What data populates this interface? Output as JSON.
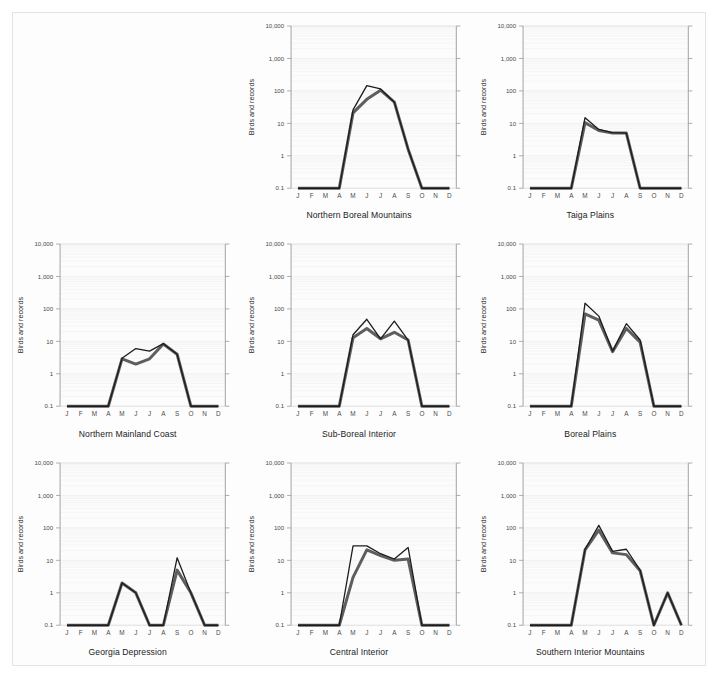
{
  "figure": {
    "background_color": "#fdfdfd",
    "frame_color": "#e3e3e3",
    "axis_color": "#9a9a9a",
    "grid_major_color": "#d8d8d8",
    "grid_minor_color": "#efefef",
    "thin_line_color": "#1c1c1c",
    "thick_line_color": "#5e5e5e",
    "y_axis_label": "Birds and records",
    "y_tick_labels": [
      "10,000",
      "1,000",
      "100",
      "10",
      "1",
      "0.1"
    ],
    "x_tick_labels": [
      "J",
      "F",
      "M",
      "A",
      "M",
      "J",
      "J",
      "A",
      "S",
      "O",
      "N",
      "D"
    ],
    "panel_order": [
      "empty",
      "northern-boreal-mountains",
      "taiga-plains",
      "northern-mainland-coast",
      "sub-boreal-interior",
      "boreal-plains",
      "georgia-depression",
      "central-interior",
      "southern-interior-mountains"
    ]
  },
  "chart_data": [
    {
      "type": "line",
      "title": "Northern Boreal Mountains",
      "xlabel": "",
      "ylabel": "Birds and records",
      "yscale": "log",
      "ylim": [
        0.1,
        10000
      ],
      "grid": true,
      "categories": [
        "J",
        "F",
        "M",
        "A",
        "M",
        "J",
        "J",
        "A",
        "S",
        "O",
        "N",
        "D"
      ],
      "series": [
        {
          "name": "records",
          "style": "thin",
          "values": [
            0.1,
            0.1,
            0.1,
            0.1,
            26,
            145,
            115,
            45,
            1.6,
            0.1,
            0.1,
            0.1
          ]
        },
        {
          "name": "birds",
          "style": "thick",
          "values": [
            0.1,
            0.1,
            0.1,
            0.1,
            21,
            55,
            105,
            45,
            1.6,
            0.1,
            0.1,
            0.1
          ]
        }
      ]
    },
    {
      "type": "line",
      "title": "Taiga Plains",
      "xlabel": "",
      "ylabel": "Birds and records",
      "yscale": "log",
      "ylim": [
        0.1,
        10000
      ],
      "grid": true,
      "categories": [
        "J",
        "F",
        "M",
        "A",
        "M",
        "J",
        "J",
        "A",
        "S",
        "O",
        "N",
        "D"
      ],
      "series": [
        {
          "name": "records",
          "style": "thin",
          "values": [
            0.1,
            0.1,
            0.1,
            0.1,
            15,
            6.5,
            5.2,
            5.0,
            0.1,
            0.1,
            0.1,
            0.1
          ]
        },
        {
          "name": "birds",
          "style": "thick",
          "values": [
            0.1,
            0.1,
            0.1,
            0.1,
            10.5,
            6.0,
            5.0,
            5.0,
            0.1,
            0.1,
            0.1,
            0.1
          ]
        }
      ]
    },
    {
      "type": "line",
      "title": "Northern Mainland Coast",
      "xlabel": "",
      "ylabel": "Birds and records",
      "yscale": "log",
      "ylim": [
        0.1,
        10000
      ],
      "grid": true,
      "categories": [
        "J",
        "F",
        "M",
        "A",
        "M",
        "J",
        "J",
        "A",
        "S",
        "O",
        "N",
        "D"
      ],
      "series": [
        {
          "name": "records",
          "style": "thin",
          "values": [
            0.1,
            0.1,
            0.1,
            0.1,
            3.0,
            6.0,
            5.0,
            8.5,
            4.0,
            0.1,
            0.1,
            0.1
          ]
        },
        {
          "name": "birds",
          "style": "thick",
          "values": [
            0.1,
            0.1,
            0.1,
            0.1,
            2.9,
            2.0,
            2.9,
            8.3,
            4.0,
            0.1,
            0.1,
            0.1
          ]
        }
      ]
    },
    {
      "type": "line",
      "title": "Sub-Boreal Interior",
      "xlabel": "",
      "ylabel": "Birds and records",
      "yscale": "log",
      "ylim": [
        0.1,
        10000
      ],
      "grid": true,
      "categories": [
        "J",
        "F",
        "M",
        "A",
        "M",
        "J",
        "J",
        "A",
        "S",
        "O",
        "N",
        "D"
      ],
      "series": [
        {
          "name": "records",
          "style": "thin",
          "values": [
            0.1,
            0.1,
            0.1,
            0.1,
            16,
            48,
            12,
            42,
            11,
            0.1,
            0.1,
            0.1
          ]
        },
        {
          "name": "birds",
          "style": "thick",
          "values": [
            0.1,
            0.1,
            0.1,
            0.1,
            13,
            25,
            12,
            19,
            11,
            0.1,
            0.1,
            0.1
          ]
        }
      ]
    },
    {
      "type": "line",
      "title": "Boreal Plains",
      "xlabel": "",
      "ylabel": "Birds and records",
      "yscale": "log",
      "ylim": [
        0.1,
        10000
      ],
      "grid": true,
      "categories": [
        "J",
        "F",
        "M",
        "A",
        "M",
        "J",
        "J",
        "A",
        "S",
        "O",
        "N",
        "D"
      ],
      "series": [
        {
          "name": "records",
          "style": "thin",
          "values": [
            0.1,
            0.1,
            0.1,
            0.1,
            150,
            60,
            5.0,
            35,
            11,
            0.1,
            0.1,
            0.1
          ]
        },
        {
          "name": "birds",
          "style": "thick",
          "values": [
            0.1,
            0.1,
            0.1,
            0.1,
            70,
            45,
            4.8,
            25,
            9.5,
            0.1,
            0.1,
            0.1
          ]
        }
      ]
    },
    {
      "type": "line",
      "title": "Georgia Depression",
      "xlabel": "",
      "ylabel": "Birds and records",
      "yscale": "log",
      "ylim": [
        0.1,
        10000
      ],
      "grid": true,
      "categories": [
        "J",
        "F",
        "M",
        "A",
        "M",
        "J",
        "J",
        "A",
        "S",
        "O",
        "N",
        "D"
      ],
      "series": [
        {
          "name": "records",
          "style": "thin",
          "values": [
            0.1,
            0.1,
            0.1,
            0.1,
            2.0,
            1.0,
            0.1,
            0.1,
            12,
            1.0,
            0.1,
            0.1
          ]
        },
        {
          "name": "birds",
          "style": "thick",
          "values": [
            0.1,
            0.1,
            0.1,
            0.1,
            2.0,
            1.0,
            0.1,
            0.1,
            5.0,
            1.0,
            0.1,
            0.1
          ]
        }
      ]
    },
    {
      "type": "line",
      "title": "Central Interior",
      "xlabel": "",
      "ylabel": "Birds and records",
      "yscale": "log",
      "ylim": [
        0.1,
        10000
      ],
      "grid": true,
      "categories": [
        "J",
        "F",
        "M",
        "A",
        "M",
        "J",
        "J",
        "A",
        "S",
        "O",
        "N",
        "D"
      ],
      "series": [
        {
          "name": "records",
          "style": "thin",
          "values": [
            0.1,
            0.1,
            0.1,
            0.1,
            28,
            28,
            16,
            11,
            25,
            0.1,
            0.1,
            0.1
          ]
        },
        {
          "name": "birds",
          "style": "thick",
          "values": [
            0.1,
            0.1,
            0.1,
            0.1,
            3.0,
            21,
            14,
            10,
            11,
            0.1,
            0.1,
            0.1
          ]
        }
      ]
    },
    {
      "type": "line",
      "title": "Southern Interior Mountains",
      "xlabel": "",
      "ylabel": "Birds and records",
      "yscale": "log",
      "ylim": [
        0.1,
        10000
      ],
      "grid": true,
      "categories": [
        "J",
        "F",
        "M",
        "A",
        "M",
        "J",
        "J",
        "A",
        "S",
        "O",
        "N",
        "D"
      ],
      "series": [
        {
          "name": "records",
          "style": "thin",
          "values": [
            0.1,
            0.1,
            0.1,
            0.1,
            22,
            120,
            19,
            22,
            5.0,
            0.1,
            1.0,
            0.1
          ]
        },
        {
          "name": "birds",
          "style": "thick",
          "values": [
            0.1,
            0.1,
            0.1,
            0.1,
            21,
            85,
            17,
            15,
            4.8,
            0.1,
            1.0,
            0.1
          ]
        }
      ]
    }
  ]
}
